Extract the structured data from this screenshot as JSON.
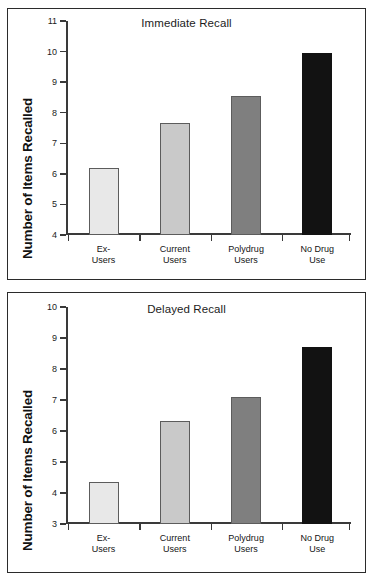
{
  "figure": {
    "background": "#ffffff",
    "border_color": "#2b2b2b"
  },
  "chart_data": [
    {
      "type": "bar",
      "title": "Immediate Recall",
      "xlabel": "",
      "ylabel": "Number of Items Recalled",
      "categories": [
        "Ex-\nUsers",
        "Current\nUsers",
        "Polydrug\nUsers",
        "No Drug\nUse"
      ],
      "category_lines": [
        [
          "Ex-",
          "Users"
        ],
        [
          "Current",
          "Users"
        ],
        [
          "Polydrug",
          "Users"
        ],
        [
          "No Drug",
          "Use"
        ]
      ],
      "values": [
        6.2,
        7.65,
        8.55,
        9.95
      ],
      "bar_colors": [
        "#e8e8e8",
        "#c9c9c9",
        "#7f7f7f",
        "#121212"
      ],
      "ylim": [
        4,
        11
      ],
      "yticks": [
        4,
        5,
        6,
        7,
        8,
        9,
        10,
        11
      ],
      "ytick_labels": [
        "4",
        "5",
        "6",
        "7",
        "8",
        "9",
        "10",
        "11"
      ],
      "grid": false,
      "legend": "none"
    },
    {
      "type": "bar",
      "title": "Delayed Recall",
      "xlabel": "",
      "ylabel": "Number of Items Recalled",
      "categories": [
        "Ex-\nUsers",
        "Current\nUsers",
        "Polydrug\nUsers",
        "No Drug\nUse"
      ],
      "category_lines": [
        [
          "Ex-",
          "Users"
        ],
        [
          "Current",
          "Users"
        ],
        [
          "Polydrug",
          "Users"
        ],
        [
          "No Drug",
          "Use"
        ]
      ],
      "values": [
        4.35,
        6.32,
        7.1,
        8.7
      ],
      "bar_colors": [
        "#e8e8e8",
        "#c9c9c9",
        "#7f7f7f",
        "#121212"
      ],
      "ylim": [
        3,
        10
      ],
      "yticks": [
        3,
        4,
        5,
        6,
        7,
        8,
        9,
        10
      ],
      "ytick_labels": [
        "3",
        "4",
        "5",
        "6",
        "7",
        "8",
        "9",
        "10"
      ],
      "grid": false,
      "legend": "none"
    }
  ]
}
